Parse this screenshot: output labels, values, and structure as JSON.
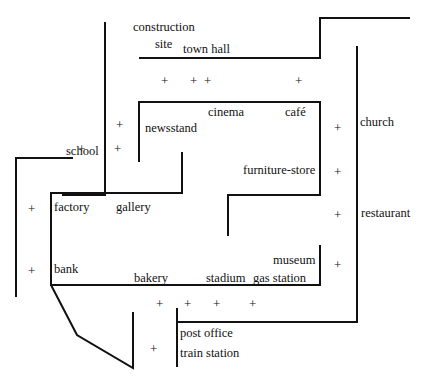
{
  "map": {
    "stroke_color": "#111111",
    "background": "#ffffff",
    "lines": [
      {
        "id": "top-left-vertical",
        "points": "105,22 105,195 62,195"
      },
      {
        "id": "town-hall-street",
        "points": "139,58 320,58 320,18 410,18"
      },
      {
        "id": "inner-block",
        "points": "139,162 139,102 320,102 320,195 228,195 228,236"
      },
      {
        "id": "right-long-street",
        "points": "357,46 357,322 177,322"
      },
      {
        "id": "left-outer",
        "points": "73,158 16,158 16,297"
      },
      {
        "id": "factory-block",
        "points": "182,152 182,193 51,193 51,285 320,285 320,245"
      },
      {
        "id": "diagonal-road",
        "points": "51,285 77,335 133,368 133,312"
      },
      {
        "id": "post-office-line",
        "points": "177,367 177,308"
      }
    ],
    "labels": [
      {
        "id": "construction",
        "text": "construction",
        "x": 133,
        "y": 20
      },
      {
        "id": "site",
        "text": "site",
        "x": 155,
        "y": 37
      },
      {
        "id": "town-hall",
        "text": "town hall",
        "x": 183,
        "y": 42
      },
      {
        "id": "cinema",
        "text": "cinema",
        "x": 208,
        "y": 105
      },
      {
        "id": "cafe",
        "text": "café",
        "x": 285,
        "y": 105
      },
      {
        "id": "newsstand",
        "text": "newsstand",
        "x": 145,
        "y": 121
      },
      {
        "id": "church",
        "text": "church",
        "x": 360,
        "y": 115
      },
      {
        "id": "school",
        "text": "school",
        "x": 66,
        "y": 144
      },
      {
        "id": "furniture-store",
        "text": "furniture-store",
        "x": 243,
        "y": 163
      },
      {
        "id": "factory",
        "text": "factory",
        "x": 54,
        "y": 200
      },
      {
        "id": "gallery",
        "text": "gallery",
        "x": 116,
        "y": 200
      },
      {
        "id": "restaurant",
        "text": "restaurant",
        "x": 361,
        "y": 206
      },
      {
        "id": "museum",
        "text": "museum",
        "x": 273,
        "y": 253
      },
      {
        "id": "bank",
        "text": "bank",
        "x": 54,
        "y": 262
      },
      {
        "id": "bakery",
        "text": "bakery",
        "x": 134,
        "y": 271
      },
      {
        "id": "stadium",
        "text": "stadium",
        "x": 206,
        "y": 271
      },
      {
        "id": "gas-station",
        "text": "gas station",
        "x": 253,
        "y": 271
      },
      {
        "id": "post-office",
        "text": "post office",
        "x": 180,
        "y": 326
      },
      {
        "id": "train-station",
        "text": "train station",
        "x": 180,
        "y": 346
      }
    ],
    "markers": [
      {
        "id": "plus-1",
        "glyph": "+",
        "x": 161,
        "y": 74
      },
      {
        "id": "plus-2",
        "glyph": "+",
        "x": 190,
        "y": 74
      },
      {
        "id": "plus-3",
        "glyph": "+",
        "x": 204,
        "y": 74
      },
      {
        "id": "plus-4",
        "glyph": "+",
        "x": 295,
        "y": 74
      },
      {
        "id": "plus-5",
        "glyph": "+",
        "x": 116,
        "y": 118
      },
      {
        "id": "plus-6",
        "glyph": "+",
        "x": 334,
        "y": 121
      },
      {
        "id": "plus-7",
        "glyph": "+",
        "x": 78,
        "y": 142
      },
      {
        "id": "plus-8",
        "glyph": "+",
        "x": 114,
        "y": 142
      },
      {
        "id": "plus-9",
        "glyph": "+",
        "x": 334,
        "y": 165
      },
      {
        "id": "plus-10",
        "glyph": "+",
        "x": 28,
        "y": 202
      },
      {
        "id": "plus-11",
        "glyph": "+",
        "x": 334,
        "y": 208
      },
      {
        "id": "plus-12",
        "glyph": "+",
        "x": 334,
        "y": 258
      },
      {
        "id": "plus-13",
        "glyph": "+",
        "x": 28,
        "y": 264
      },
      {
        "id": "plus-14",
        "glyph": "+",
        "x": 156,
        "y": 297
      },
      {
        "id": "plus-15",
        "glyph": "+",
        "x": 184,
        "y": 297
      },
      {
        "id": "plus-16",
        "glyph": "+",
        "x": 213,
        "y": 297
      },
      {
        "id": "plus-17",
        "glyph": "+",
        "x": 249,
        "y": 297
      },
      {
        "id": "plus-18",
        "glyph": "+",
        "x": 150,
        "y": 342
      }
    ]
  }
}
